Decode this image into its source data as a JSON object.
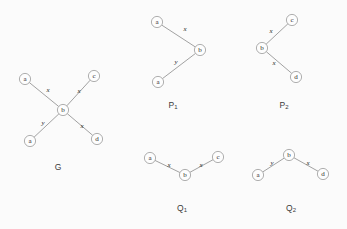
{
  "figure": {
    "background_color": "#fbfbfb",
    "node_fill": "#fdfdfd",
    "node_stroke": "#9a9a9a",
    "edge_color": "#8a8a8a",
    "text_color": "#2b2b2b",
    "node_radius": 5.6
  },
  "graphs": [
    {
      "id": "G",
      "caption": "G",
      "caption_base": "G",
      "caption_sub": "",
      "caption_x": 58,
      "caption_y": 167,
      "nodes": [
        {
          "id": "g-a-top",
          "label": "a",
          "x": 25,
          "y": 79
        },
        {
          "id": "g-c",
          "label": "c",
          "x": 94,
          "y": 76
        },
        {
          "id": "g-b",
          "label": "b",
          "x": 63,
          "y": 110
        },
        {
          "id": "g-a-bottom",
          "label": "a",
          "x": 30,
          "y": 141
        },
        {
          "id": "g-d",
          "label": "d",
          "x": 97,
          "y": 139
        }
      ],
      "edges": [
        {
          "from": "g-a-top",
          "to": "g-b",
          "label": "x",
          "lx": 48,
          "ly": 90
        },
        {
          "from": "g-c",
          "to": "g-b",
          "label": "x",
          "lx": 79,
          "ly": 91
        },
        {
          "from": "g-a-bottom",
          "to": "g-b",
          "label": "y",
          "lx": 43,
          "ly": 123
        },
        {
          "from": "g-d",
          "to": "g-b",
          "label": "x",
          "lx": 82,
          "ly": 126
        }
      ]
    },
    {
      "id": "P1",
      "caption": "P₁",
      "caption_base": "P",
      "caption_sub": "1",
      "caption_x": 173,
      "caption_y": 105,
      "nodes": [
        {
          "id": "p1-a-top",
          "label": "a",
          "x": 157,
          "y": 22
        },
        {
          "id": "p1-b",
          "label": "b",
          "x": 200,
          "y": 50
        },
        {
          "id": "p1-a-bottom",
          "label": "a",
          "x": 158,
          "y": 82
        }
      ],
      "edges": [
        {
          "from": "p1-a-top",
          "to": "p1-b",
          "label": "x",
          "lx": 185,
          "ly": 29
        },
        {
          "from": "p1-a-bottom",
          "to": "p1-b",
          "label": "y",
          "lx": 176,
          "ly": 62
        }
      ]
    },
    {
      "id": "P2",
      "caption": "P₂",
      "caption_base": "P",
      "caption_sub": "2",
      "caption_x": 284,
      "caption_y": 105,
      "nodes": [
        {
          "id": "p2-c",
          "label": "c",
          "x": 292,
          "y": 20
        },
        {
          "id": "p2-b",
          "label": "b",
          "x": 262,
          "y": 48
        },
        {
          "id": "p2-d",
          "label": "d",
          "x": 296,
          "y": 77
        }
      ],
      "edges": [
        {
          "from": "p2-c",
          "to": "p2-b",
          "label": "x",
          "lx": 271,
          "ly": 31
        },
        {
          "from": "p2-d",
          "to": "p2-b",
          "label": "x",
          "lx": 274,
          "ly": 63
        }
      ]
    },
    {
      "id": "Q1",
      "caption": "Q₁",
      "caption_base": "Q",
      "caption_sub": "1",
      "caption_x": 182,
      "caption_y": 208,
      "nodes": [
        {
          "id": "q1-a",
          "label": "a",
          "x": 150,
          "y": 158
        },
        {
          "id": "q1-c",
          "label": "c",
          "x": 218,
          "y": 157
        },
        {
          "id": "q1-b",
          "label": "b",
          "x": 185,
          "y": 175
        }
      ],
      "edges": [
        {
          "from": "q1-a",
          "to": "q1-b",
          "label": "x",
          "lx": 169,
          "ly": 165
        },
        {
          "from": "q1-c",
          "to": "q1-b",
          "label": "x",
          "lx": 201,
          "ly": 165
        }
      ]
    },
    {
      "id": "Q2",
      "caption": "Q₂",
      "caption_base": "Q",
      "caption_sub": "2",
      "caption_x": 291,
      "caption_y": 208,
      "nodes": [
        {
          "id": "q2-b",
          "label": "b",
          "x": 289,
          "y": 155
        },
        {
          "id": "q2-a",
          "label": "a",
          "x": 258,
          "y": 175
        },
        {
          "id": "q2-d",
          "label": "d",
          "x": 323,
          "y": 174
        }
      ],
      "edges": [
        {
          "from": "q2-a",
          "to": "q2-b",
          "label": "y",
          "lx": 272,
          "ly": 163
        },
        {
          "from": "q2-d",
          "to": "q2-b",
          "label": "x",
          "lx": 308,
          "ly": 163
        }
      ]
    }
  ]
}
